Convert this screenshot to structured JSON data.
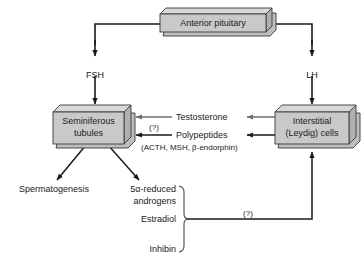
{
  "diagram": {
    "colors": {
      "box_fill": "#c9c9c9",
      "box_fill_top": "#d8d8d8",
      "box_fill_side": "#b0b0b0",
      "box_stroke": "#3a3a3a",
      "arrow_dark": "#1a1a1a",
      "arrow_gray": "#6e6e6e",
      "text": "#1a1a1a",
      "background": "#ffffff"
    },
    "boxes": [
      {
        "id": "anterior_pituitary",
        "label": "Anterior pituitary"
      },
      {
        "id": "seminiferous_tubules",
        "label_line1": "Seminiferous",
        "label_line2": "tubules"
      },
      {
        "id": "interstitial_cells",
        "label_line1": "Interstitial",
        "label_line2": "(Leydig) cells"
      }
    ],
    "hormone_labels": [
      {
        "id": "fsh",
        "label": "FSH"
      },
      {
        "id": "lh",
        "label": "LH"
      }
    ],
    "feedback_labels": [
      {
        "id": "testosterone",
        "label": "Testosterone"
      },
      {
        "id": "polypeptides",
        "label": "Polypeptides"
      },
      {
        "id": "polypeptides_detail",
        "label": "(ACTH, MSH, β-endorphin)"
      }
    ],
    "outputs": [
      {
        "id": "spermatogenesis",
        "label": "Spermatogenesis"
      },
      {
        "id": "5a_reduced_androgens_line1",
        "label": "5α-reduced"
      },
      {
        "id": "5a_reduced_androgens_line2",
        "label": "androgens"
      },
      {
        "id": "estradiol",
        "label": "Estradiol"
      },
      {
        "id": "inhibin",
        "label": "Inhibin"
      }
    ],
    "uncertainty_markers": [
      {
        "id": "q_tubule_feedback",
        "label": "(?)"
      },
      {
        "id": "q_brace_feedback",
        "label": "(?)"
      }
    ]
  }
}
